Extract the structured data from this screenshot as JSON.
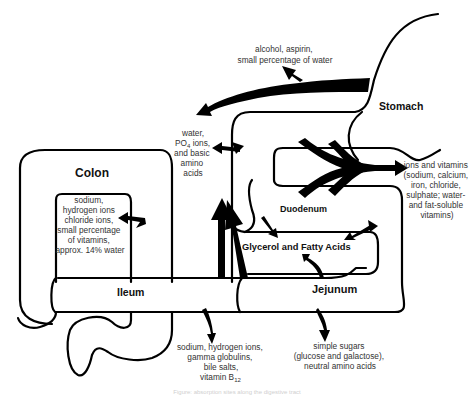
{
  "organs": {
    "stomach": "Stomach",
    "duodenum": "Duodenum",
    "jejunum": "Jejunum",
    "ileum": "Ileum",
    "colon": "Colon",
    "glycerol": "Glycerol and Fatty Acids"
  },
  "annotations": {
    "stomach_absorption": [
      "alcohol, aspirin,",
      "small percentage of water"
    ],
    "duodenum_upper": [
      "water,",
      "PO",
      "4",
      " ions,",
      "and basic",
      "amino",
      "acids"
    ],
    "duodenum_ions": [
      "ions and vitamins",
      "(sodium, calcium,",
      "iron, chloride,",
      "sulphate; water-",
      "and fat-soluble",
      "vitamins)"
    ],
    "colon_absorption": [
      "sodium,",
      "hydrogen ions",
      "chloride ions,",
      "small percentage",
      "of vitamins,",
      "approx. 14% water"
    ],
    "ileum_absorption": [
      "sodium, hydrogen ions,",
      "gamma globulins,",
      "bile salts,",
      "vitamin B",
      "12"
    ],
    "jejunum_absorption": [
      "simple sugars",
      "(glucose and galactose),",
      "neutral amino acids"
    ]
  },
  "caption": "Figure: absorption sites along the digestive tract"
}
